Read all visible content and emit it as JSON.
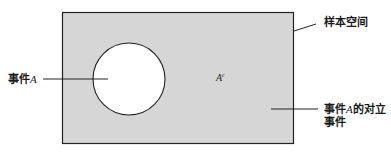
{
  "diagram": {
    "type": "venn",
    "colors": {
      "sample_space_fill": "#d6d6d6",
      "event_fill": "#ffffff",
      "stroke": "#222222"
    },
    "labels": {
      "sample_space": "样本空间",
      "event_a_prefix": "事件",
      "event_a_var": "A",
      "complement_symbol_base": "A",
      "complement_symbol_sup": "c",
      "complement_line1_prefix": "事件",
      "complement_line1_var": "A",
      "complement_line1_suffix": "的对立",
      "complement_line2": "事件"
    }
  }
}
